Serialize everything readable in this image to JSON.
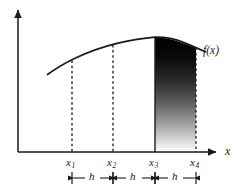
{
  "figure": {
    "kind": "calculus-integration-diagram",
    "background_color": "#ffffff",
    "ink_color": "#1a1a1a",
    "axes": {
      "y_axis_name": "y-axis",
      "x_axis_label": "x",
      "origin_px": {
        "x": 18,
        "y": 152
      },
      "x_axis_end_px": {
        "x": 222,
        "y": 152
      },
      "y_axis_top_px": {
        "x": 18,
        "y": 8
      }
    },
    "curve": {
      "label": "f(x)",
      "label_pos_px": {
        "x": 203,
        "y": 52
      },
      "stroke_width": 1.6,
      "points_px": [
        {
          "x": 48,
          "y": 74
        },
        {
          "x": 72,
          "y": 60
        },
        {
          "x": 95,
          "y": 50
        },
        {
          "x": 113,
          "y": 45
        },
        {
          "x": 135,
          "y": 40
        },
        {
          "x": 152,
          "y": 37
        },
        {
          "x": 168,
          "y": 38
        },
        {
          "x": 185,
          "y": 43
        },
        {
          "x": 196,
          "y": 47
        },
        {
          "x": 205,
          "y": 50
        }
      ]
    },
    "gridlines": [
      {
        "name": "dashed-line-x1",
        "x_px": 72,
        "style": "dashed",
        "top_px": 60,
        "bottom_px": 152
      },
      {
        "name": "dashed-line-x2",
        "x_px": 113,
        "style": "dashed",
        "top_px": 45,
        "bottom_px": 152
      },
      {
        "name": "solid-line-x3",
        "x_px": 155,
        "style": "solid",
        "top_px": 37,
        "bottom_px": 152
      },
      {
        "name": "dashed-line-x4",
        "x_px": 196,
        "style": "dashed",
        "top_px": 47,
        "bottom_px": 152
      }
    ],
    "tick_labels": [
      {
        "base": "x",
        "sub": "1",
        "x_px": 72,
        "y_px": 156
      },
      {
        "base": "x",
        "sub": "2",
        "x_px": 113,
        "y_px": 156
      },
      {
        "base": "x",
        "sub": "3",
        "x_px": 155,
        "y_px": 156
      },
      {
        "base": "x",
        "sub": "4",
        "x_px": 196,
        "y_px": 156
      }
    ],
    "shaded_region": {
      "name": "integral-area-x3-to-x4",
      "from": "x3",
      "to": "x4",
      "gradient": {
        "top_color": "#000000",
        "bottom_color": "#ffffff",
        "direction": "vertical"
      }
    },
    "spacing_bars": [
      {
        "label": "h",
        "from_px": 72,
        "to_px": 113,
        "y_px": 178
      },
      {
        "label": "h",
        "from_px": 113,
        "to_px": 155,
        "y_px": 178
      },
      {
        "label": "h",
        "from_px": 155,
        "to_px": 196,
        "y_px": 178
      }
    ]
  }
}
